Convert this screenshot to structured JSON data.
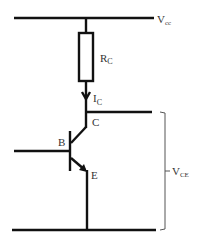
{
  "diagram": {
    "type": "circuit",
    "labels": {
      "vcc_main": "V",
      "vcc_sub": "cc",
      "rc_main": "R",
      "rc_sub": "C",
      "ic_main": "I",
      "ic_sub": "C",
      "collector": "C",
      "base": "B",
      "emitter": "E",
      "vce_main": "V",
      "vce_sub": "CE"
    },
    "components": [
      {
        "id": "top-rail",
        "kind": "wire",
        "label": "Vcc"
      },
      {
        "id": "resistor",
        "kind": "resistor",
        "label": "RC"
      },
      {
        "id": "current-arrow",
        "kind": "current",
        "label": "IC"
      },
      {
        "id": "transistor",
        "kind": "npn-bjt",
        "terminals": [
          "C",
          "B",
          "E"
        ]
      },
      {
        "id": "bottom-rail",
        "kind": "wire"
      },
      {
        "id": "vce-bracket",
        "kind": "voltage-brace",
        "label": "VCE"
      }
    ],
    "colors": {
      "wire": "#111111",
      "label": "#333333",
      "bracket": "#555555",
      "background": "#ffffff"
    }
  }
}
